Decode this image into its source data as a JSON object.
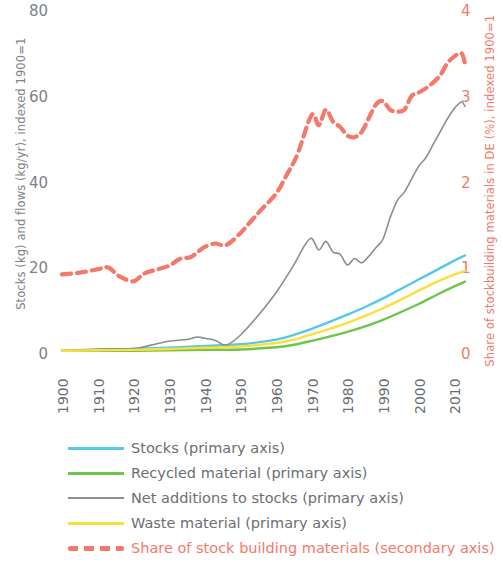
{
  "chart_data": {
    "type": "line",
    "title": "",
    "xlabel": "",
    "ylabel": "Stocks (kg) and flows (kg/yr), indexed 1900=1",
    "ylabel_secondary": "Share of stockbuilding materials in DE (%), indexed 1900=1",
    "xlim": [
      1900,
      2013
    ],
    "ylim": [
      0,
      80
    ],
    "ylim_secondary": [
      0,
      4
    ],
    "xticks": [
      "1900",
      "1910",
      "1920",
      "1930",
      "1940",
      "1950",
      "1960",
      "1970",
      "1980",
      "1990",
      "2000",
      "2010"
    ],
    "xtick_values": [
      1900,
      1910,
      1920,
      1930,
      1940,
      1950,
      1960,
      1970,
      1980,
      1990,
      2000,
      2010
    ],
    "yticks": [
      "0",
      "20",
      "40",
      "60",
      "80"
    ],
    "ytick_values": [
      0,
      20,
      40,
      60,
      80
    ],
    "yticks_secondary": [
      "0",
      "1",
      "2",
      "3",
      "4"
    ],
    "ytick_values_secondary": [
      0,
      1,
      2,
      3,
      4
    ],
    "grid": false,
    "legend_position": "below",
    "colors": {
      "stocks": "#55c8e8",
      "recycled": "#6fc44c",
      "net_additions": "#8d8d8d",
      "waste": "#fbe03c",
      "share": "#f4796b",
      "axis_text": "#808285",
      "xtick_text": "#6d6e71",
      "background": "#ffffff"
    },
    "series": [
      {
        "name": "Stocks (primary axis)",
        "axis": "primary",
        "color": "#55c8e8",
        "style": "solid",
        "x": [
          1900,
          1910,
          1920,
          1930,
          1940,
          1950,
          1960,
          1965,
          1970,
          1975,
          1980,
          1985,
          1990,
          1995,
          2000,
          2005,
          2010,
          2013
        ],
        "values": [
          1.0,
          1.2,
          1.4,
          1.7,
          2.1,
          2.5,
          3.6,
          4.7,
          6.1,
          7.7,
          9.4,
          11.2,
          13.2,
          15.4,
          17.6,
          19.8,
          22.0,
          23.2
        ]
      },
      {
        "name": "Recycled material (primary axis)",
        "axis": "primary",
        "color": "#6fc44c",
        "style": "solid",
        "x": [
          1900,
          1910,
          1920,
          1930,
          1940,
          1950,
          1960,
          1965,
          1970,
          1975,
          1980,
          1985,
          1990,
          1995,
          2000,
          2005,
          2010,
          2013
        ],
        "values": [
          1.0,
          1.0,
          1.0,
          1.1,
          1.2,
          1.3,
          1.8,
          2.4,
          3.3,
          4.3,
          5.4,
          6.7,
          8.2,
          10.0,
          11.9,
          14.0,
          16.0,
          17.1
        ]
      },
      {
        "name": "Net additions to stocks (primary axis)",
        "axis": "primary",
        "color": "#8d8d8d",
        "style": "solid",
        "x": [
          1900,
          1910,
          1920,
          1925,
          1930,
          1935,
          1938,
          1940,
          1943,
          1946,
          1950,
          1955,
          1960,
          1965,
          1968,
          1970,
          1972,
          1974,
          1976,
          1978,
          1980,
          1982,
          1984,
          1986,
          1988,
          1990,
          1992,
          1994,
          1996,
          1998,
          2000,
          2002,
          2004,
          2006,
          2008,
          2010,
          2012,
          2013
        ],
        "values": [
          1.0,
          1.4,
          1.5,
          2.3,
          3.2,
          3.6,
          4.2,
          3.9,
          3.4,
          2.3,
          4.6,
          9.2,
          14.5,
          21.0,
          25.5,
          27.2,
          24.5,
          26.5,
          24.0,
          23.5,
          21.0,
          22.5,
          21.5,
          23.0,
          25.0,
          27.0,
          32.0,
          36.0,
          38.0,
          41.0,
          44.0,
          46.0,
          49.0,
          52.0,
          55.0,
          57.5,
          59.0,
          58.0
        ]
      },
      {
        "name": "Waste material (primary axis)",
        "axis": "primary",
        "color": "#fbe03c",
        "style": "solid",
        "x": [
          1900,
          1910,
          1920,
          1930,
          1940,
          1950,
          1960,
          1965,
          1970,
          1975,
          1980,
          1985,
          1990,
          1995,
          2000,
          2005,
          2010,
          2013
        ],
        "values": [
          1.0,
          1.1,
          1.2,
          1.4,
          1.7,
          2.0,
          2.8,
          3.6,
          4.8,
          6.1,
          7.5,
          9.1,
          10.9,
          12.9,
          15.0,
          17.0,
          18.8,
          19.6
        ]
      },
      {
        "name": "Share of stock building materials (secondary axis)",
        "axis": "secondary",
        "color": "#f4796b",
        "style": "dashed",
        "x": [
          1900,
          1905,
          1910,
          1913,
          1916,
          1920,
          1923,
          1926,
          1930,
          1933,
          1936,
          1938,
          1940,
          1943,
          1946,
          1950,
          1953,
          1956,
          1960,
          1963,
          1966,
          1970,
          1972,
          1974,
          1976,
          1978,
          1980,
          1982,
          1984,
          1986,
          1988,
          1990,
          1992,
          1994,
          1996,
          1998,
          2000,
          2003,
          2006,
          2008,
          2010,
          2012,
          2013
        ],
        "values": [
          0.94,
          0.96,
          1.0,
          1.02,
          0.92,
          0.86,
          0.95,
          0.99,
          1.04,
          1.12,
          1.14,
          1.2,
          1.26,
          1.3,
          1.28,
          1.42,
          1.56,
          1.7,
          1.88,
          2.1,
          2.34,
          2.8,
          2.68,
          2.86,
          2.72,
          2.66,
          2.56,
          2.54,
          2.6,
          2.76,
          2.92,
          2.96,
          2.86,
          2.84,
          2.86,
          3.02,
          3.06,
          3.14,
          3.26,
          3.4,
          3.48,
          3.52,
          3.4
        ]
      }
    ]
  },
  "axes": {
    "left_title": "Stocks (kg) and flows (kg/yr), indexed 1900=1",
    "right_title": "Share of stockbuilding materials in DE (%), indexed 1900=1"
  },
  "legend": {
    "items": [
      {
        "label": "Stocks (primary axis)",
        "color": "#55c8e8",
        "style": "solid",
        "accent": false
      },
      {
        "label": "Recycled material (primary axis)",
        "color": "#6fc44c",
        "style": "solid",
        "accent": false
      },
      {
        "label": "Net additions to stocks (primary axis)",
        "color": "#8d8d8d",
        "style": "solid",
        "accent": false
      },
      {
        "label": "Waste material (primary axis)",
        "color": "#fbe03c",
        "style": "solid",
        "accent": false
      },
      {
        "label": "Share of stock building materials (secondary axis)",
        "color": "#f4796b",
        "style": "dashed",
        "accent": true
      }
    ]
  }
}
